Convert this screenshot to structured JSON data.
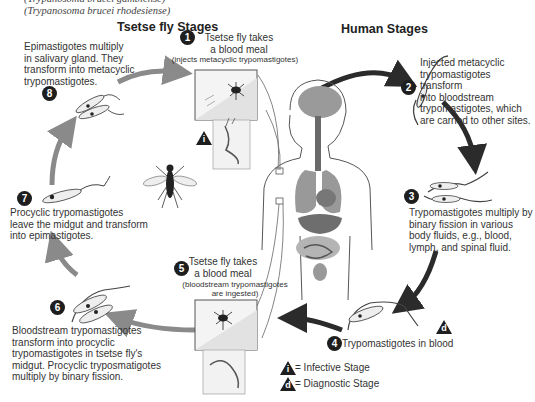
{
  "header": {
    "subtitle_line1": "(Trypanosoma brucei gambiense)",
    "subtitle_line2": "(Trypanosoma brucei rhodesiense)"
  },
  "sections": {
    "tsetse": "Tsetse fly Stages",
    "human": "Human Stages"
  },
  "stages": [
    {
      "number": "1",
      "title_line1": "Tsetse fly takes",
      "title_line2": "a blood meal",
      "note": "(injects metacyclic trypomastigotes)",
      "host": "tsetse"
    },
    {
      "number": "2",
      "text_lines": [
        "Injected metacyclic",
        "trypomastigotes transform",
        "into bloodstream",
        "trypomastigotes, which",
        "are carried to other sites."
      ],
      "host": "human"
    },
    {
      "number": "3",
      "text_lines": [
        "Trypomastigotes multiply by",
        "binary fission in various",
        "body fluids, e.g., blood,",
        "lymph, and spinal fluid."
      ],
      "host": "human"
    },
    {
      "number": "4",
      "text": "Trypomastigotes in blood",
      "host": "human"
    },
    {
      "number": "5",
      "title_line1": "Tsetse fly takes",
      "title_line2": "a blood meal",
      "note_line1": "(bloodstream trypomastigotes",
      "note_line2": "are ingested)",
      "host": "tsetse"
    },
    {
      "number": "6",
      "text_lines": [
        "Bloodstream trypomastigotes",
        "transform into procyclic",
        "trypomastigotes in tsetse fly's",
        "midgut. Procyclic tryposmatigotes",
        "multiply by binary fission."
      ],
      "host": "tsetse"
    },
    {
      "number": "7",
      "text_lines": [
        "Procyclic trypomastigotes",
        "leave the midgut and transform",
        "into epimastigotes."
      ],
      "host": "tsetse"
    },
    {
      "number": "8",
      "text_lines": [
        "Epimastigotes multiply",
        "in salivary gland. They",
        "transform into metacyclic",
        "trypomastigotes."
      ],
      "host": "tsetse"
    }
  ],
  "markers": {
    "infective_letter": "i",
    "diagnostic_letter": "d"
  },
  "legend": {
    "infective_label": "= Infective Stage",
    "diagnostic_label": "= Diagnostic Stage"
  },
  "colors": {
    "human_arrow": "#2b2b2b",
    "tsetse_arrow": "#8a8a8a",
    "badge": "#1e1e1e",
    "text": "#333333"
  }
}
